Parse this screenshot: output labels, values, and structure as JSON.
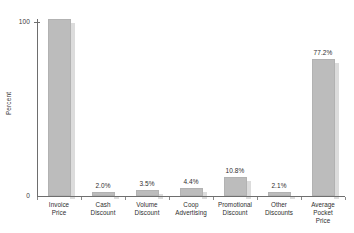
{
  "chart_data": {
    "type": "bar",
    "title": "",
    "subtitle": "",
    "xlabel": "",
    "ylabel": "Percent",
    "ylim": [
      0,
      100
    ],
    "yticks": [
      0,
      100
    ],
    "ytick_labels": [
      "0",
      "100"
    ],
    "grid": false,
    "legend": null,
    "categories": [
      "Invoice Price",
      "Cash Discount",
      "Volume Discount",
      "Coop Advertising",
      "Promotional Discount",
      "Other Discounts",
      "Average Pocket Price"
    ],
    "category_lines": [
      [
        "Invoice",
        "Price"
      ],
      [
        "Cash",
        "Discount"
      ],
      [
        "Volume",
        "Discount"
      ],
      [
        "Coop",
        "Advertising"
      ],
      [
        "Promotional",
        "Discount"
      ],
      [
        "Other",
        "Discounts"
      ],
      [
        "Average",
        "Pocket",
        "Price"
      ]
    ],
    "values": [
      100.0,
      2.0,
      3.5,
      4.4,
      10.8,
      2.1,
      77.2
    ],
    "value_labels": [
      "",
      "2.0%",
      "3.5%",
      "4.4%",
      "10.8%",
      "2.1%",
      "77.2%"
    ],
    "colors": {
      "bar": "#bcbcbc",
      "bar_shadow": "#dcdcdc",
      "axis": "#6e6e6e",
      "text": "#2e2e2e",
      "background": "#ffffff"
    }
  }
}
